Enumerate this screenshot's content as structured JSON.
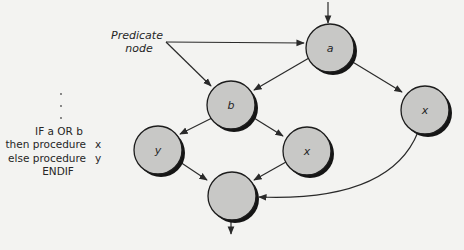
{
  "diagram": {
    "annotation": {
      "line1": "Predicate",
      "line2": "node"
    },
    "code": {
      "dots": [
        "·",
        "·",
        "·"
      ],
      "line1": "IF a OR b",
      "line2": "then procedure",
      "line2_var": "x",
      "line3": "else procedure",
      "line3_var": "y",
      "line4": "ENDIF"
    },
    "nodes": {
      "a": {
        "label": "a",
        "predicate": true
      },
      "b": {
        "label": "b",
        "predicate": true
      },
      "x_right": {
        "label": "x"
      },
      "y": {
        "label": "y"
      },
      "x_mid": {
        "label": "x"
      },
      "join": {
        "label": ""
      }
    },
    "edges": [
      {
        "from": "entry",
        "to": "a"
      },
      {
        "from": "a",
        "to": "b"
      },
      {
        "from": "a",
        "to": "x_right"
      },
      {
        "from": "b",
        "to": "y"
      },
      {
        "from": "b",
        "to": "x_mid"
      },
      {
        "from": "y",
        "to": "join"
      },
      {
        "from": "x_mid",
        "to": "join"
      },
      {
        "from": "x_right",
        "to": "join",
        "curved": true
      },
      {
        "from": "join",
        "to": "exit"
      },
      {
        "from": "annotation",
        "to": "a",
        "kind": "callout"
      },
      {
        "from": "annotation",
        "to": "b",
        "kind": "callout"
      }
    ],
    "colors": {
      "background": "#f3f3f1",
      "node_fill": "#c8c8c6",
      "node_stroke": "#1c1c1c",
      "node_shadow": "#151515",
      "edge": "#2a2a2a",
      "text": "#262626"
    }
  }
}
